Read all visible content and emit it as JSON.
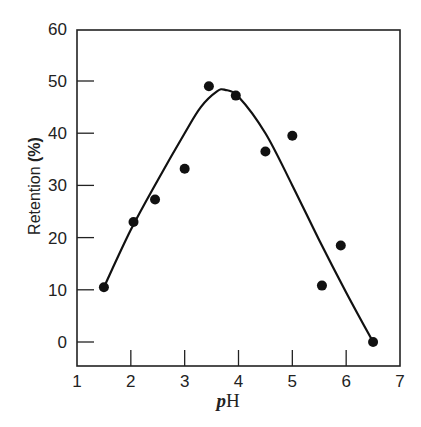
{
  "chart_data": {
    "type": "scatter",
    "title": "",
    "xlabel": "pH",
    "ylabel": "Retention (%)",
    "xlim": [
      1,
      7
    ],
    "ylim": [
      -5,
      60
    ],
    "x_ticks": [
      1,
      2,
      3,
      4,
      5,
      6,
      7
    ],
    "y_ticks": [
      0,
      10,
      20,
      30,
      40,
      50,
      60
    ],
    "grid": false,
    "legend": null,
    "series": [
      {
        "name": "measured",
        "type": "scatter",
        "x": [
          1.5,
          2.05,
          2.45,
          3.0,
          3.45,
          3.95,
          4.5,
          5.0,
          5.55,
          5.9,
          6.5
        ],
        "y": [
          10.5,
          23,
          27.3,
          33.2,
          49,
          47.2,
          36.5,
          39.5,
          10.8,
          18.5,
          0
        ]
      },
      {
        "name": "fitted curve",
        "type": "line",
        "x": [
          1.5,
          2.0,
          2.5,
          3.0,
          3.3,
          3.6,
          3.75,
          4.0,
          4.5,
          5.0,
          5.5,
          6.0,
          6.5
        ],
        "y": [
          10.5,
          21.5,
          31,
          40,
          45,
          48,
          48.3,
          47,
          40,
          30,
          19.5,
          9.5,
          0
        ]
      }
    ]
  },
  "labels": {
    "y_axis_title_main": "Retention ",
    "y_axis_title_unit": "(%)",
    "x_axis_title_italic": "p",
    "x_axis_title_rest": "H",
    "x_tick_labels": [
      "1",
      "2",
      "3",
      "4",
      "5",
      "6",
      "7"
    ],
    "y_tick_labels": [
      "0",
      "10",
      "20",
      "30",
      "40",
      "50",
      "60"
    ]
  }
}
